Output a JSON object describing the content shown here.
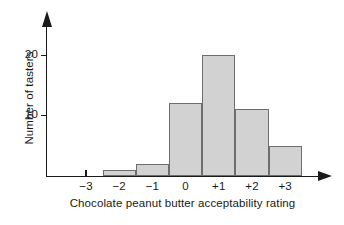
{
  "chart_data": {
    "type": "bar",
    "title": "",
    "xlabel": "Chocolate peanut butter acceptability rating",
    "ylabel": "Number of tasters",
    "categories": [
      "-3",
      "-2",
      "-1",
      "0",
      "+1",
      "+2",
      "+3"
    ],
    "values": [
      0,
      1,
      2,
      12,
      20,
      11,
      5
    ],
    "y_ticks": [
      10,
      20
    ],
    "y_tick_labels": [
      "10",
      "20"
    ],
    "ylim": [
      0,
      26
    ],
    "xlim": [
      -3.5,
      3.5
    ],
    "grid": false,
    "legend": null,
    "bar_fill_color": "#d2d2d2",
    "bar_border_color": "#6e6e6e",
    "axis_color": "#1a1a1a",
    "background_color": "#ffffff",
    "axis_style": "arrow-tipped"
  }
}
